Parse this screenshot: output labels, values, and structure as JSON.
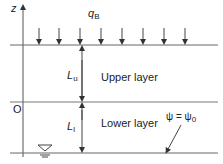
{
  "diagram": {
    "axis": {
      "label": "z"
    },
    "load": {
      "symbol": "q",
      "subscript": "B",
      "arrow_count": 8
    },
    "origin_label": "O",
    "upper": {
      "dim_symbol": "L",
      "dim_subscript": "u",
      "layer_label": "Upper layer"
    },
    "lower": {
      "dim_symbol": "L",
      "dim_subscript": "l",
      "layer_label": "Lower layer"
    },
    "boundary_condition": "ψ = ψ",
    "boundary_subscript": "0",
    "water_table_icon": "water-table-triangle",
    "colors": {
      "line": "#555555",
      "text": "#222222"
    }
  }
}
